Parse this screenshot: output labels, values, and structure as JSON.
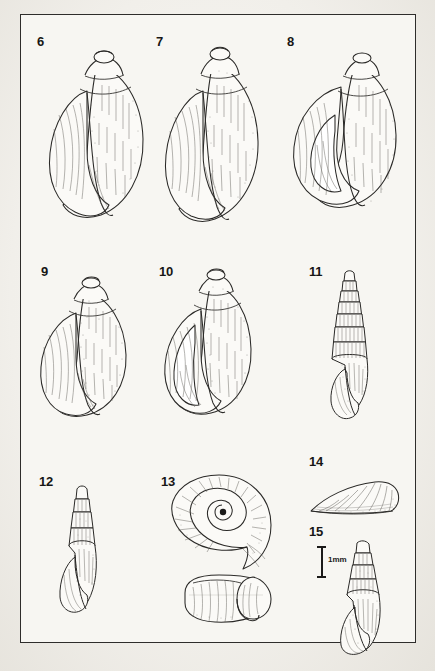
{
  "plate": {
    "kind": "scientific-illustration-plate",
    "subject": "freshwater gastropod shells",
    "background_color": "#f2f0ec",
    "paper_color": "#f7f6f2",
    "ink_color": "#1b1a19",
    "frame": {
      "border_color": "#2e2d2b",
      "x": 20,
      "y": 14,
      "width": 396,
      "height": 629
    }
  },
  "scale_bar": {
    "label": "1mm",
    "orientation": "vertical",
    "x": 318,
    "y": 545,
    "length_px": 32
  },
  "figures": [
    {
      "number": "6",
      "label_x": 36,
      "label_y": 34,
      "shell_x": 38,
      "shell_y": 44,
      "width": 108,
      "height": 180,
      "form": "ovate-globose",
      "view": "apertural",
      "whorls": 4,
      "aperture": "large, oval, left side"
    },
    {
      "number": "7",
      "label_x": 155,
      "label_y": 34,
      "shell_x": 152,
      "shell_y": 40,
      "width": 110,
      "height": 186,
      "form": "ovate-conic",
      "view": "apertural",
      "whorls": 4,
      "aperture": "large, elongate-oval, left side"
    },
    {
      "number": "8",
      "label_x": 286,
      "label_y": 34,
      "shell_x": 287,
      "shell_y": 48,
      "width": 118,
      "height": 160,
      "form": "broadly ovate, inflated",
      "view": "apertural, tilted",
      "whorls": 3,
      "aperture": "very large, rounded"
    },
    {
      "number": "9",
      "label_x": 40,
      "label_y": 264,
      "shell_x": 32,
      "shell_y": 275,
      "width": 100,
      "height": 135,
      "form": "ovate-globose",
      "view": "apertural",
      "whorls": 4,
      "aperture": "large, oval"
    },
    {
      "number": "10",
      "label_x": 158,
      "label_y": 264,
      "shell_x": 152,
      "shell_y": 270,
      "width": 102,
      "height": 138,
      "form": "ovate, thick-lipped",
      "view": "apertural",
      "whorls": 4,
      "aperture": "large, oval, reflected lip"
    },
    {
      "number": "11",
      "label_x": 310,
      "label_y": 264,
      "shell_x": 326,
      "shell_y": 272,
      "width": 48,
      "height": 150,
      "form": "elongate turreted",
      "view": "apertural",
      "whorls": 9,
      "aperture": "small, oval, basal"
    },
    {
      "number": "12",
      "label_x": 38,
      "label_y": 474,
      "shell_x": 56,
      "shell_y": 486,
      "width": 52,
      "height": 124,
      "form": "elongate-conic",
      "view": "apertural",
      "whorls": 7,
      "aperture": "oval, basal"
    },
    {
      "number": "13",
      "label_x": 160,
      "label_y": 474,
      "shell_x": 168,
      "shell_y": 466,
      "width": 110,
      "height": 160,
      "form": "planispiral discoid",
      "view": "two views: spiral face and apertural/edge",
      "whorls": 4,
      "aperture": "crescentic, peripheral"
    },
    {
      "number": "14",
      "label_x": 310,
      "label_y": 455,
      "shell_x": 306,
      "shell_y": 473,
      "width": 100,
      "height": 36,
      "form": "low conical limpet-like (cap-shaped)",
      "view": "lateral",
      "whorls": 1,
      "aperture": "wide basal opening"
    },
    {
      "number": "15",
      "label_x": 310,
      "label_y": 524,
      "shell_x": 334,
      "shell_y": 536,
      "width": 62,
      "height": 106,
      "form": "ovate-conic",
      "view": "apertural",
      "whorls": 6,
      "aperture": "oval, basal"
    }
  ]
}
